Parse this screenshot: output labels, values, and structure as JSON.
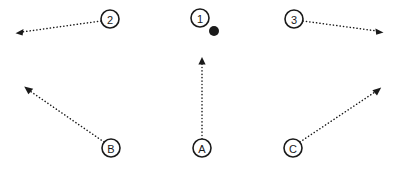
{
  "canvas": {
    "width": 403,
    "height": 169,
    "background": "#ffffff",
    "ink_color": "#1a1a1a"
  },
  "diagram": {
    "type": "dotted-arrow-node-diagram",
    "nodes": [
      {
        "id": "node-2",
        "label": "2",
        "cx": 110,
        "cy": 19,
        "r": 9
      },
      {
        "id": "node-1",
        "label": "1",
        "cx": 200,
        "cy": 18,
        "r": 9
      },
      {
        "id": "node-3",
        "label": "3",
        "cx": 294,
        "cy": 19,
        "r": 9
      },
      {
        "id": "node-B",
        "label": "B",
        "cx": 111,
        "cy": 148,
        "r": 9
      },
      {
        "id": "node-A",
        "label": "A",
        "cx": 202,
        "cy": 148,
        "r": 9
      },
      {
        "id": "node-C",
        "label": "C",
        "cx": 293,
        "cy": 148,
        "r": 9
      }
    ],
    "markers": [
      {
        "id": "marker-dot-1",
        "cx": 214,
        "cy": 31,
        "r": 5,
        "filled": true
      }
    ],
    "arrows": [
      {
        "id": "arrow-2",
        "from": "node-2",
        "x1": 101,
        "y1": 21,
        "x2": 17,
        "y2": 33
      },
      {
        "id": "arrow-3",
        "from": "node-3",
        "x1": 303,
        "y1": 21,
        "x2": 382,
        "y2": 32
      },
      {
        "id": "arrow-B",
        "from": "node-B",
        "x1": 104,
        "y1": 142,
        "x2": 25,
        "y2": 87
      },
      {
        "id": "arrow-A",
        "from": "node-A",
        "x1": 202,
        "y1": 139,
        "x2": 202,
        "y2": 58
      },
      {
        "id": "arrow-C",
        "from": "node-C",
        "x1": 300,
        "y1": 142,
        "x2": 381,
        "y2": 88
      }
    ]
  }
}
